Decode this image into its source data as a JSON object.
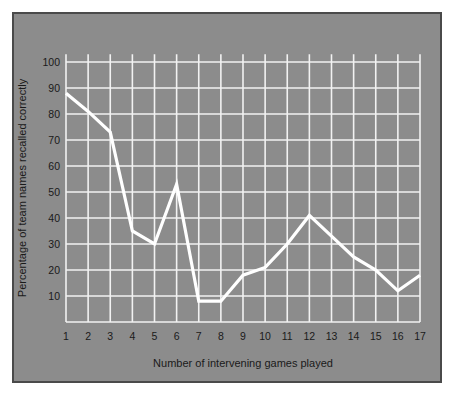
{
  "chart_data": {
    "type": "line",
    "title": "",
    "subtitle": "",
    "xlabel": "Number of intervening games played",
    "ylabel": "Percentage of team names recalled correctly",
    "x": [
      1,
      2,
      3,
      4,
      5,
      6,
      7,
      8,
      9,
      10,
      11,
      12,
      13,
      14,
      15,
      16,
      17
    ],
    "values": [
      88,
      81,
      73,
      35,
      30,
      53,
      8,
      8,
      18,
      21,
      30,
      41,
      33,
      25,
      20,
      12,
      18
    ],
    "series": [
      {
        "name": "Percentage of team names recalled correctly",
        "values": [
          88,
          81,
          73,
          35,
          30,
          53,
          8,
          8,
          18,
          21,
          30,
          41,
          33,
          25,
          20,
          12,
          18
        ]
      }
    ],
    "xtick_labels": [
      "1",
      "2",
      "3",
      "4",
      "5",
      "6",
      "7",
      "8",
      "9",
      "10",
      "11",
      "12",
      "13",
      "14",
      "15",
      "16",
      "17"
    ],
    "ytick_labels": [
      "10",
      "20",
      "30",
      "40",
      "50",
      "60",
      "70",
      "80",
      "90",
      "100"
    ],
    "yticks": [
      10,
      20,
      30,
      40,
      50,
      60,
      70,
      80,
      90,
      100
    ],
    "xlim": [
      0.4,
      17.6
    ],
    "ylim": [
      0,
      103
    ],
    "grid": true,
    "grid_color": "#f2f2f2",
    "line_color": "#ffffff",
    "line_width": 3.2,
    "panel_color": "#8c8c8c",
    "background_color": "#ffffff",
    "border_color": "#4a4a4a",
    "text_color": "#1a1a1a",
    "legend": null,
    "legend_position": "none",
    "annotations": []
  }
}
